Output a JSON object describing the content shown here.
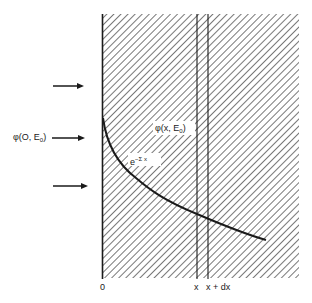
{
  "diagram": {
    "title": "",
    "labels": {
      "incident_flux_prefix": "φ(O, E",
      "incident_flux_sub": "0",
      "incident_flux_suffix": ")",
      "local_flux_prefix": "φ(x, E",
      "local_flux_sub": "0",
      "local_flux_suffix": ")",
      "decay_base": "e",
      "decay_exponent": "−Σ x",
      "origin": "0",
      "x_label": "x",
      "x_dx_label": "x + dx"
    },
    "arrows": [
      {
        "name": "upper-incident-arrow",
        "y": 86
      },
      {
        "name": "middle-incident-arrow",
        "y": 138
      },
      {
        "name": "lower-incident-arrow",
        "y": 186
      }
    ],
    "slab": {
      "left": 102,
      "top": 14,
      "right": 299,
      "bottom": 278,
      "hatch": "diagonal"
    },
    "lines": {
      "x": 197,
      "x_plus_dx": 208
    },
    "curve": {
      "type": "exponential-decay",
      "start": [
        103,
        118
      ],
      "end": [
        266,
        240
      ]
    },
    "colors": {
      "ink": "#1a1a1a",
      "hatch": "#555555",
      "background": "#ffffff"
    }
  }
}
